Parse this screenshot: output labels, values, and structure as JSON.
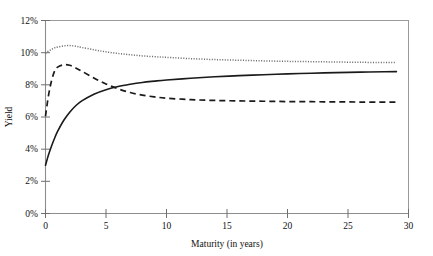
{
  "chart_data": {
    "type": "line",
    "title": "",
    "xlabel": "Maturity (in years)",
    "ylabel": "Yield",
    "xlim": [
      0,
      30
    ],
    "ylim": [
      0,
      12
    ],
    "grid": false,
    "legend": "none",
    "x_tick_labels": [
      "0",
      "5",
      "10",
      "15",
      "20",
      "25",
      "30"
    ],
    "x_ticks": [
      0,
      5,
      10,
      15,
      20,
      25,
      30
    ],
    "y_tick_labels": [
      "0%",
      "2%",
      "4%",
      "6%",
      "8%",
      "10%",
      "12%"
    ],
    "y_ticks": [
      0,
      2,
      4,
      6,
      8,
      10,
      12
    ],
    "y_unit": "%",
    "x": [
      0,
      0.25,
      0.5,
      0.75,
      1,
      1.5,
      2,
      2.5,
      3,
      4,
      5,
      6,
      7,
      8,
      9,
      10,
      12,
      14,
      16,
      18,
      20,
      22,
      24,
      26,
      28,
      29
    ],
    "series": [
      {
        "name": "dotted-curve",
        "style": "dotted",
        "color": "#707070",
        "values": [
          9.95,
          10.1,
          10.2,
          10.3,
          10.35,
          10.42,
          10.44,
          10.4,
          10.32,
          10.18,
          10.05,
          9.95,
          9.87,
          9.8,
          9.75,
          9.71,
          9.63,
          9.57,
          9.53,
          9.49,
          9.46,
          9.44,
          9.42,
          9.4,
          9.39,
          9.38
        ]
      },
      {
        "name": "dashed-curve",
        "style": "dashed",
        "color": "#1a1a1a",
        "values": [
          6.05,
          7.35,
          8.25,
          8.85,
          9.1,
          9.25,
          9.22,
          9.05,
          8.85,
          8.42,
          8.05,
          7.75,
          7.52,
          7.36,
          7.25,
          7.17,
          7.08,
          7.03,
          7.0,
          6.98,
          6.96,
          6.95,
          6.94,
          6.93,
          6.92,
          6.92
        ]
      },
      {
        "name": "solid-curve",
        "style": "solid",
        "color": "#1a1a1a",
        "values": [
          3.0,
          3.65,
          4.2,
          4.68,
          5.1,
          5.78,
          6.3,
          6.7,
          7.0,
          7.42,
          7.7,
          7.9,
          8.04,
          8.15,
          8.23,
          8.3,
          8.41,
          8.5,
          8.57,
          8.63,
          8.68,
          8.72,
          8.76,
          8.79,
          8.81,
          8.82
        ]
      }
    ],
    "annotations": []
  },
  "axis": {
    "x_title": "Maturity (in years)",
    "y_title": "Yield"
  }
}
